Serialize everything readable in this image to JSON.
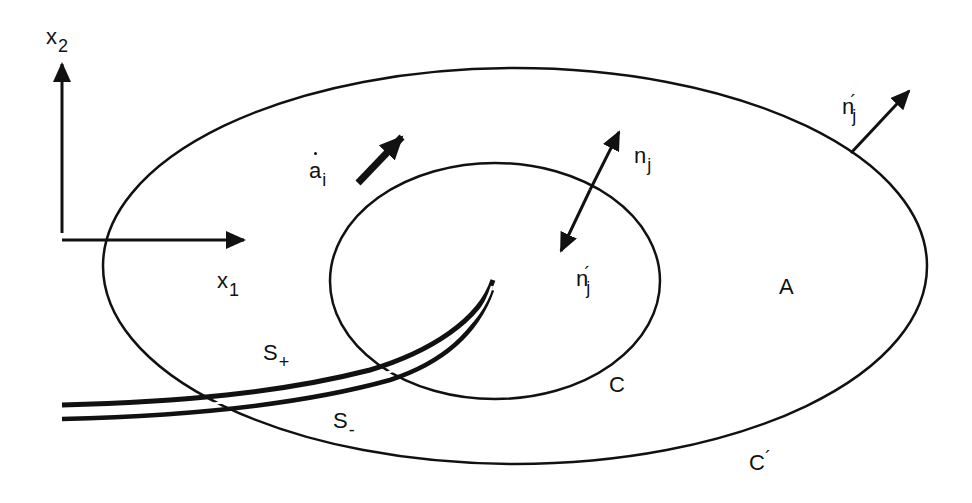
{
  "figure": {
    "type": "crack-path-domain-diagram",
    "colors": {
      "ink": "#111111",
      "background": "#ffffff"
    }
  },
  "axes": {
    "x1": {
      "base": "x",
      "sub": "1"
    },
    "x2": {
      "base": "x",
      "sub": "2"
    }
  },
  "labels": {
    "crack_velocity": {
      "base": "a",
      "sub": "i",
      "dot": true
    },
    "inner_normal_out": {
      "base": "n",
      "sub": "j"
    },
    "inner_normal_in": {
      "base": "n",
      "sub": "j",
      "prime": "´"
    },
    "outer_normal": {
      "base": "n",
      "sub": "j",
      "prime": "´"
    },
    "region": "A",
    "inner_contour": "C",
    "outer_contour": {
      "base": "C",
      "prime": "´"
    },
    "upper_face": {
      "base": "S",
      "sub": "+"
    },
    "lower_face": {
      "base": "S",
      "sub": "-"
    }
  },
  "geometry": {
    "outer_ellipse": {
      "cx": 515,
      "cy": 266,
      "rx": 412,
      "ry": 198
    },
    "inner_ellipse": {
      "cx": 495,
      "cy": 281,
      "rx": 165,
      "ry": 118
    },
    "crack_tip": {
      "x": 493,
      "y": 280
    }
  }
}
